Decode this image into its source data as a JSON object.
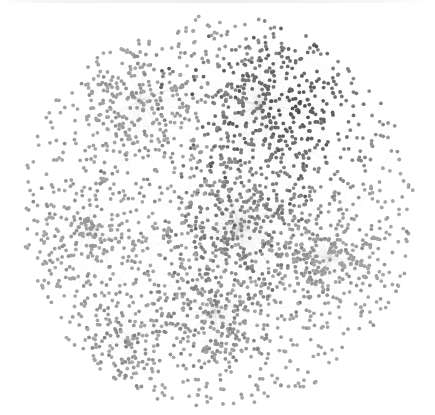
{
  "diagram": {
    "type": "network-graph",
    "layout": "force-directed",
    "canvas": {
      "width": 435,
      "height": 415,
      "background": "#ffffff"
    },
    "boundary": {
      "cx": 218,
      "cy": 212,
      "r": 197
    },
    "node_count": 2600,
    "node_radius": 1.9,
    "edge_color": "#c8c8c8",
    "edge_opacity": 0.22,
    "colors": {
      "node_light": "#a6a6a6",
      "node_mid": "#8a8a8a",
      "node_dark": "#4a4a4a"
    },
    "hubs": [
      {
        "name": "center-hub",
        "x": 240,
        "y": 228,
        "weight": 0.22,
        "spread": 70,
        "darkness": 0.55
      },
      {
        "name": "top-right-hub",
        "x": 258,
        "y": 105,
        "weight": 0.18,
        "spread": 75,
        "darkness": 0.85
      },
      {
        "name": "right-hub",
        "x": 330,
        "y": 258,
        "weight": 0.15,
        "spread": 55,
        "darkness": 0.2
      },
      {
        "name": "lower-hub",
        "x": 215,
        "y": 310,
        "weight": 0.12,
        "spread": 60,
        "darkness": 0.35
      },
      {
        "name": "upper-left-hub",
        "x": 140,
        "y": 100,
        "weight": 0.1,
        "spread": 60,
        "darkness": 0.25
      },
      {
        "name": "left-hub",
        "x": 90,
        "y": 230,
        "weight": 0.08,
        "spread": 55,
        "darkness": 0.2
      },
      {
        "name": "bottom-left-hub",
        "x": 130,
        "y": 340,
        "weight": 0.07,
        "spread": 50,
        "darkness": 0.3
      }
    ],
    "dark_region": {
      "x": 300,
      "y": 110,
      "r": 120
    }
  }
}
